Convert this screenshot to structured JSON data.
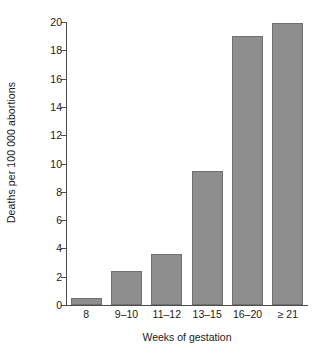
{
  "chart_data": {
    "type": "bar",
    "title": "",
    "subtitle": "",
    "categories": [
      "8",
      "9–10",
      "11–12",
      "13–15",
      "16–20",
      "≥ 21"
    ],
    "values": [
      0.5,
      2.4,
      3.6,
      9.5,
      19.0,
      19.9
    ],
    "series": [
      {
        "name": "Deaths per 100 000 abortions",
        "values": [
          0.5,
          2.4,
          3.6,
          9.5,
          19.0,
          19.9
        ]
      }
    ],
    "xlabel": "Weeks of gestation",
    "ylabel": "Deaths per 100 000 abortions",
    "ylim": [
      0,
      20
    ],
    "ytick_labels": [
      "0",
      "2",
      "4",
      "6",
      "8",
      "10",
      "12",
      "14",
      "16",
      "18",
      "20"
    ],
    "ytick_values": [
      0,
      2,
      4,
      6,
      8,
      10,
      12,
      14,
      16,
      18,
      20
    ],
    "grid": false,
    "legend": false,
    "legend_position": "none",
    "bar_color": "#8e8e8e",
    "bar_edge_color": "#707070",
    "axis_color": "#4d4d4d",
    "background_color": "#ffffff",
    "text_color": "#1a1a1a"
  }
}
